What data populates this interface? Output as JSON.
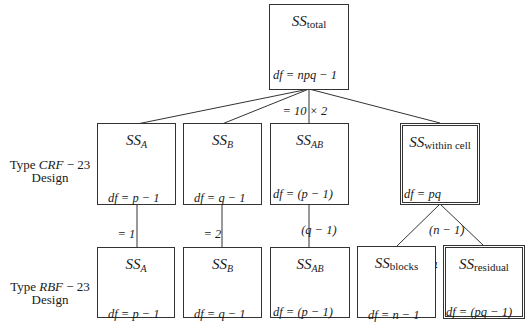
{
  "row_labels": {
    "crf": {
      "line1_prefix": "Type ",
      "line1_italic": "CRF",
      "line1_suffix": " − 23",
      "line2": "Design"
    },
    "rbf": {
      "line1_prefix": "Type ",
      "line1_italic": "RBF",
      "line1_suffix": " − 23",
      "line2": "Design"
    }
  },
  "nodes": {
    "total": {
      "ss": "SS",
      "sub": "total",
      "lines": [
        "df = npq − 1",
        "   = 10 × 2",
        "       × 3 − 1",
        "   = 59"
      ]
    },
    "crf_a": {
      "ss": "SS",
      "sub": "A",
      "lines": [
        "df = p − 1",
        "   = 1"
      ]
    },
    "crf_b": {
      "ss": "SS",
      "sub": "B",
      "lines": [
        "df = q − 1",
        "   = 2"
      ]
    },
    "crf_ab": {
      "ss": "SS",
      "sub": "AB",
      "lines": [
        "df = (p − 1)",
        "         (q − 1)",
        "   = 2"
      ]
    },
    "within_cell": {
      "ss": "SS",
      "sub": "within cell",
      "lines": [
        "df = pq",
        "        (n − 1)",
        "   = 54"
      ]
    },
    "rbf_a": {
      "ss": "SS",
      "sub": "A",
      "lines": [
        "df = p − 1",
        "   = 1"
      ]
    },
    "rbf_b": {
      "ss": "SS",
      "sub": "B",
      "lines": [
        "df = q − 1",
        "   = 2"
      ]
    },
    "rbf_ab": {
      "ss": "SS",
      "sub": "AB",
      "lines": [
        "df = (p − 1)",
        "         (q − 1)",
        "   = 2"
      ]
    },
    "blocks": {
      "ss": "SS",
      "sub": "blocks",
      "lines": [
        "df = n − 1",
        "   = 9"
      ]
    },
    "residual": {
      "ss": "SS",
      "sub": "residual",
      "lines": [
        "df = (pq − 1)",
        "          (n − 1)",
        "   = 45"
      ]
    }
  }
}
